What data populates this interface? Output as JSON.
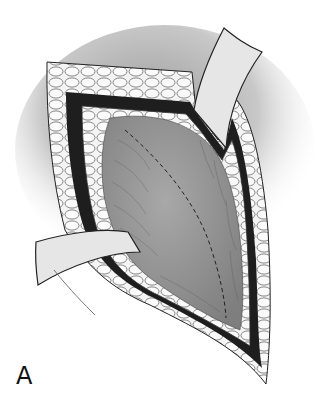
{
  "figure": {
    "panel_label": "A",
    "elements": [
      "skin-shadow",
      "subcutaneous-fat-layer",
      "fascia-band",
      "muscle-surface",
      "dashed-incision-line",
      "upper-retractor",
      "left-retractor"
    ]
  },
  "colors": {
    "background": "#ffffff",
    "shadow": "#bdbdbd",
    "fat": "#f2f2f2",
    "fascia": "#1e1e1e",
    "muscle": "#9a9a9a",
    "retractor": "#e6e6e6",
    "outline": "#222222"
  }
}
